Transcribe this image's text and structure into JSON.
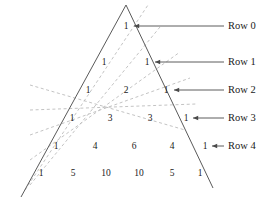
{
  "figure": {
    "type": "diagram",
    "name": "pascals-triangle-with-diagonals",
    "colors": {
      "triangle_stroke": "#5a5a5a",
      "diagonal_dashed_stroke": "#bcbcbc",
      "leader_stroke": "#4a4a4a",
      "text": "#1a1a1a",
      "background": "#ffffff"
    },
    "triangle": {
      "apex": {
        "x": 126,
        "y": 5
      },
      "bottom_left": {
        "x": 21,
        "y": 197
      },
      "bottom_right": {
        "x": 213,
        "y": 188
      }
    },
    "rows": [
      {
        "label": "Row 0",
        "y": 26,
        "label_x": 228,
        "leader": {
          "x1": 201,
          "x2": 224,
          "y": 26
        },
        "arrow_tip_x": 134,
        "values": [
          1
        ],
        "value_x": [
          126
        ]
      },
      {
        "label": "Row 1",
        "y": 62,
        "label_x": 228,
        "leader": {
          "x1": 201,
          "x2": 224,
          "y": 62
        },
        "arrow_tip_x": 155,
        "values": [
          1,
          1
        ],
        "value_x": [
          104,
          147
        ]
      },
      {
        "label": "Row 2",
        "y": 90,
        "label_x": 228,
        "leader": {
          "x1": 201,
          "x2": 224,
          "y": 90
        },
        "arrow_tip_x": 174,
        "values": [
          1,
          2,
          1
        ],
        "value_x": [
          88,
          126,
          166
        ]
      },
      {
        "label": "Row 3",
        "y": 118,
        "label_x": 228,
        "leader": {
          "x1": 201,
          "x2": 224,
          "y": 118
        },
        "arrow_tip_x": 193,
        "values": [
          1,
          3,
          3,
          1
        ],
        "value_x": [
          72,
          110,
          150,
          186
        ]
      },
      {
        "label": "Row 4",
        "y": 146,
        "label_x": 228,
        "leader": {
          "x1": 201,
          "x2": 224,
          "y": 146
        },
        "arrow_tip_x": 212,
        "values": [
          1,
          4,
          6,
          4,
          1
        ],
        "value_x": [
          56,
          95,
          134,
          172,
          205
        ]
      }
    ],
    "bottom_row": {
      "y": 173,
      "values": [
        1,
        5,
        10,
        10,
        5,
        1
      ],
      "value_x": [
        41,
        73,
        106,
        139,
        172,
        200
      ]
    },
    "diagonals": [
      {
        "x1": 30,
        "y1": 185,
        "x2": 160,
        "y2": 27
      },
      {
        "x1": 30,
        "y1": 160,
        "x2": 180,
        "y2": 52
      },
      {
        "x1": 30,
        "y1": 135,
        "x2": 190,
        "y2": 78
      },
      {
        "x1": 30,
        "y1": 110,
        "x2": 196,
        "y2": 104
      },
      {
        "x1": 30,
        "y1": 85,
        "x2": 185,
        "y2": 130
      },
      {
        "x1": 25,
        "y1": 190,
        "x2": 148,
        "y2": 5
      }
    ]
  }
}
